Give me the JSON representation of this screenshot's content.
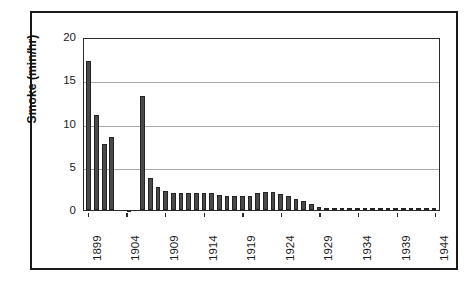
{
  "figure": {
    "background_color": "#ffffff",
    "frame_color": "#1a1a1a",
    "bar_color": "#4a4a4a",
    "bar_edge_color": "#232323",
    "grid_color": "#a9a9a9",
    "axis_color": "#2b2b2b"
  },
  "chart_data": {
    "type": "bar",
    "title": "",
    "xlabel": "",
    "ylabel": "Smoke (min/hr)",
    "ylim": [
      0,
      20
    ],
    "yticks": [
      0,
      5,
      10,
      15,
      20
    ],
    "ytick_labels": [
      "0",
      "5",
      "10",
      "15",
      "20"
    ],
    "grid": true,
    "grid_axis": "y",
    "legend": false,
    "legend_position": "none",
    "xtick_labels": [
      "1899",
      "1904",
      "1909",
      "1914",
      "1919",
      "1924",
      "1929",
      "1934",
      "1939",
      "1944"
    ],
    "xtick_years": [
      1899,
      1904,
      1909,
      1914,
      1919,
      1924,
      1929,
      1934,
      1939,
      1944
    ],
    "categories": [
      1899,
      1900,
      1901,
      1902,
      1903,
      1904,
      1905,
      1906,
      1907,
      1908,
      1909,
      1910,
      1911,
      1912,
      1913,
      1914,
      1915,
      1916,
      1917,
      1918,
      1919,
      1920,
      1921,
      1922,
      1923,
      1924,
      1925,
      1926,
      1927,
      1928,
      1929,
      1930,
      1931,
      1932,
      1933,
      1934,
      1935,
      1936,
      1937,
      1938,
      1939,
      1940,
      1941,
      1942,
      1943,
      1944
    ],
    "values": [
      17.2,
      11.0,
      7.6,
      8.4,
      null,
      null,
      null,
      13.2,
      3.7,
      2.7,
      2.2,
      2.0,
      2.0,
      2.0,
      2.0,
      2.0,
      2.0,
      1.7,
      1.6,
      1.6,
      1.6,
      1.6,
      2.0,
      2.1,
      2.1,
      1.8,
      1.6,
      1.3,
      1.1,
      0.7,
      0.4,
      0.2,
      0.2,
      0.2,
      0.2,
      0.2,
      0.2,
      0.2,
      0.2,
      0.2,
      0.2,
      0.2,
      0.2,
      0.2,
      0.2,
      0.2
    ]
  }
}
